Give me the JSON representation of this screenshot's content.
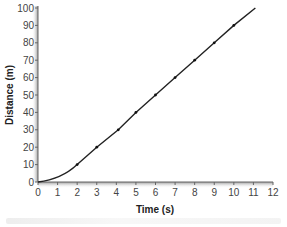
{
  "chart_data": {
    "type": "line",
    "title": "",
    "xlabel": "Time (s)",
    "ylabel": "Distance (m)",
    "xlim": [
      0,
      12
    ],
    "ylim": [
      0,
      100
    ],
    "x_ticks": [
      0,
      1,
      2,
      3,
      4,
      5,
      6,
      7,
      8,
      9,
      10,
      11,
      12
    ],
    "y_ticks": [
      0,
      10,
      20,
      30,
      40,
      50,
      60,
      70,
      80,
      90,
      100
    ],
    "grid": false,
    "legend": null,
    "series": [
      {
        "name": "Distance",
        "x": [
          0,
          2,
          3,
          4.1,
          5,
          6,
          7,
          8,
          9,
          10,
          11.1
        ],
        "values": [
          0,
          10,
          20,
          30,
          40,
          50,
          60,
          70,
          80,
          90,
          100
        ],
        "markers": [
          2,
          3,
          4.1,
          5,
          6,
          7,
          8,
          9,
          10
        ]
      }
    ]
  },
  "labels": {
    "xlabel": "Time (s)",
    "ylabel": "Distance (m)"
  }
}
